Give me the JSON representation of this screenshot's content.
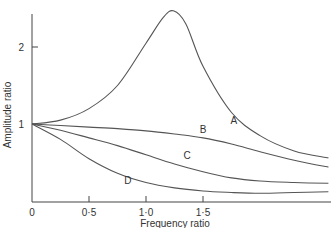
{
  "chart_data": {
    "type": "line",
    "title": "",
    "xlabel": "Frequency ratio",
    "ylabel": "Amplitude ratio",
    "xlim": [
      0,
      2.6
    ],
    "ylim": [
      0,
      2.5
    ],
    "x_ticks": [
      "0",
      "0·5",
      "1·0",
      "1·5"
    ],
    "y_ticks": [
      "1",
      "2"
    ],
    "grid": false,
    "legend": "inline labels on curves",
    "series": [
      {
        "name": "A",
        "x": [
          0,
          0.25,
          0.5,
          0.75,
          1.0,
          1.15,
          1.24,
          1.35,
          1.5,
          1.75,
          2.0,
          2.3,
          2.6
        ],
        "values": [
          1.0,
          1.05,
          1.2,
          1.5,
          2.05,
          2.38,
          2.47,
          2.3,
          1.75,
          1.15,
          0.85,
          0.65,
          0.56
        ]
      },
      {
        "name": "B",
        "x": [
          0,
          0.25,
          0.5,
          0.75,
          1.0,
          1.25,
          1.5,
          1.75,
          2.0,
          2.3,
          2.6
        ],
        "values": [
          1.0,
          0.98,
          0.96,
          0.94,
          0.91,
          0.87,
          0.82,
          0.74,
          0.64,
          0.53,
          0.44
        ]
      },
      {
        "name": "C",
        "x": [
          0,
          0.25,
          0.5,
          0.75,
          1.0,
          1.25,
          1.5,
          1.75,
          2.0,
          2.3,
          2.6
        ],
        "values": [
          1.0,
          0.92,
          0.82,
          0.72,
          0.6,
          0.48,
          0.38,
          0.3,
          0.26,
          0.24,
          0.23
        ]
      },
      {
        "name": "D",
        "x": [
          0,
          0.25,
          0.5,
          0.75,
          1.0,
          1.25,
          1.5,
          1.75,
          2.0,
          2.3,
          2.6
        ],
        "values": [
          1.0,
          0.8,
          0.55,
          0.36,
          0.24,
          0.17,
          0.13,
          0.11,
          0.1,
          0.11,
          0.12
        ]
      }
    ],
    "annotations": [
      {
        "text": "A",
        "x": 1.77,
        "y": 1.05
      },
      {
        "text": "B",
        "x": 1.5,
        "y": 0.93
      },
      {
        "text": "C",
        "x": 1.36,
        "y": 0.6
      },
      {
        "text": "D",
        "x": 0.84,
        "y": 0.27
      }
    ]
  }
}
